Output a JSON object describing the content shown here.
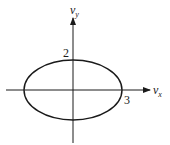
{
  "diagram": {
    "type": "ellipse-on-axes",
    "axes": {
      "x_label": "v",
      "x_subscript": "x",
      "y_label": "v",
      "y_subscript": "y"
    },
    "ellipse": {
      "semi_axis_x": 3,
      "semi_axis_y": 2,
      "label_x": "3",
      "label_y": "2"
    },
    "colors": {
      "line": "#1a1a1a",
      "background": "#ffffff"
    }
  }
}
